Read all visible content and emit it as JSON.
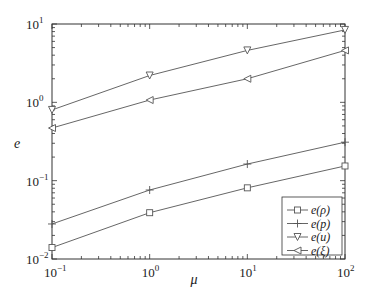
{
  "chart_data": {
    "type": "line",
    "title": "",
    "xlabel": "μ",
    "ylabel": "e",
    "xscale": "log",
    "yscale": "log",
    "xlim": [
      0.1,
      100
    ],
    "ylim": [
      0.01,
      10
    ],
    "grid": false,
    "legend_position": "lower right",
    "x": [
      0.1,
      1,
      10,
      100
    ],
    "x_tick_labels": [
      {
        "base": "10",
        "exp": "−1",
        "value": 0.1
      },
      {
        "base": "10",
        "exp": "0",
        "value": 1
      },
      {
        "base": "10",
        "exp": "1",
        "value": 10
      },
      {
        "base": "10",
        "exp": "2",
        "value": 100
      }
    ],
    "y_tick_labels": [
      {
        "base": "10",
        "exp": "−2",
        "value": 0.01
      },
      {
        "base": "10",
        "exp": "−1",
        "value": 0.1
      },
      {
        "base": "10",
        "exp": "0",
        "value": 1
      },
      {
        "base": "10",
        "exp": "1",
        "value": 10
      }
    ],
    "series": [
      {
        "name": "e(ρ)",
        "marker": "square",
        "values": [
          0.014,
          0.039,
          0.081,
          0.154
        ]
      },
      {
        "name": "e(p)",
        "marker": "plus",
        "values": [
          0.028,
          0.076,
          0.163,
          0.31
        ]
      },
      {
        "name": "e(u)",
        "marker": "triangle-down",
        "values": [
          0.8,
          2.2,
          4.6,
          8.4
        ]
      },
      {
        "name": "e(ξ)",
        "marker": "triangle-left",
        "values": [
          0.47,
          1.07,
          2.0,
          4.6
        ]
      }
    ],
    "colors": {
      "line": "#555555",
      "axis": "#333333",
      "text": "#222222"
    }
  }
}
